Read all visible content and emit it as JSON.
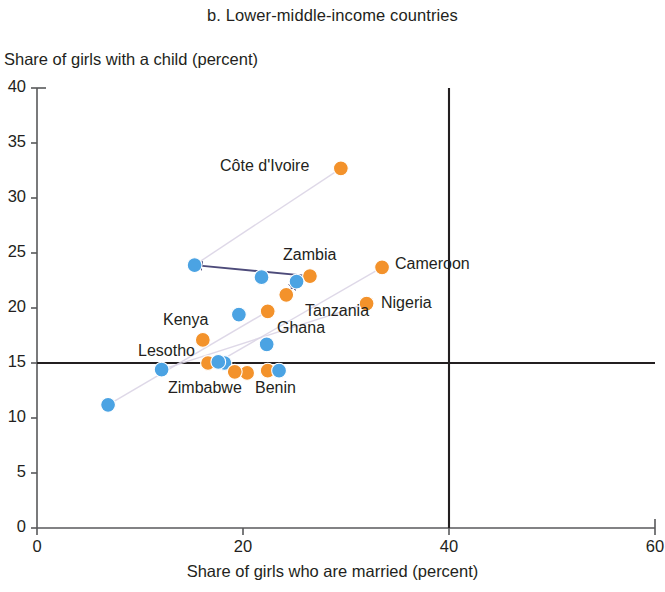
{
  "chart_data": {
    "type": "scatter",
    "title": "b. Lower-middle-income countries",
    "xlabel": "Share of girls who are married (percent)",
    "ylabel": "Share of girls with a child (percent)",
    "xlim": [
      0,
      60
    ],
    "ylim": [
      0,
      40
    ],
    "xticks": [
      0,
      20,
      40,
      60
    ],
    "yticks": [
      0,
      5,
      10,
      15,
      20,
      25,
      30,
      35,
      40
    ],
    "grid": false,
    "legend": "none",
    "reference_lines": [
      {
        "orientation": "horizontal",
        "value": 15
      },
      {
        "orientation": "vertical",
        "value": 40
      }
    ],
    "series": [
      {
        "name": "married-share (orange)",
        "color": "#f3922b",
        "marker": "circle"
      },
      {
        "name": "child-share (blue)",
        "color": "#4ba3e3",
        "marker": "circle"
      }
    ],
    "points": [
      {
        "label": "Côte d'Ivoire",
        "orange": {
          "x": 29.5,
          "y": 32.7
        },
        "blue": null,
        "arrow": false
      },
      {
        "label": "Cameroon",
        "orange": {
          "x": 33.5,
          "y": 23.7
        },
        "blue": null,
        "arrow": false
      },
      {
        "label": "Zambia",
        "orange": {
          "x": 26.5,
          "y": 22.9
        },
        "blue": {
          "x": 15.3,
          "y": 23.9
        },
        "arrow": true
      },
      {
        "label": "Nigeria",
        "orange": {
          "x": 32.0,
          "y": 20.4
        },
        "blue": null,
        "arrow": false
      },
      {
        "label": "Tanzania",
        "orange": {
          "x": 24.2,
          "y": 21.2
        },
        "blue": {
          "x": 25.2,
          "y": 22.4
        },
        "arrow": true
      },
      {
        "label": "Ghana",
        "orange": {
          "x": 22.4,
          "y": 19.7
        },
        "blue": null,
        "arrow": false
      },
      {
        "label": "Kenya",
        "orange": {
          "x": 16.1,
          "y": 17.1
        },
        "blue": {
          "x": 19.6,
          "y": 19.4
        },
        "arrow": false
      },
      {
        "label": "Lesotho",
        "orange": {
          "x": 16.6,
          "y": 15.0
        },
        "blue": {
          "x": 12.1,
          "y": 14.4
        },
        "arrow": false
      },
      {
        "label": "Zimbabwe",
        "orange": {
          "x": 19.2,
          "y": 14.2
        },
        "blue": {
          "x": 17.6,
          "y": 15.1
        },
        "arrow": false
      },
      {
        "label": "Benin",
        "orange": {
          "x": 22.4,
          "y": 14.3
        },
        "blue": {
          "x": 23.5,
          "y": 14.3
        },
        "arrow": true
      }
    ],
    "extra_points": [
      {
        "color": "blue",
        "x": 21.8,
        "y": 22.8
      },
      {
        "color": "blue",
        "x": 22.3,
        "y": 16.7
      },
      {
        "color": "blue",
        "x": 6.9,
        "y": 11.2
      },
      {
        "color": "blue",
        "x": 18.2,
        "y": 15.0
      },
      {
        "color": "orange",
        "x": 20.4,
        "y": 14.1
      }
    ]
  },
  "axis": {
    "y_tick_labels": [
      "40",
      "35",
      "30",
      "25",
      "20",
      "15",
      "10",
      "5",
      "0"
    ],
    "x_tick_labels": [
      "0",
      "20",
      "40",
      "60"
    ]
  },
  "labels": {
    "cote_divoire": "Côte d'Ivoire",
    "zambia": "Zambia",
    "cameroon": "Cameroon",
    "nigeria": "Nigeria",
    "tanzania": "Tanzania",
    "ghana": "Ghana",
    "kenya": "Kenya",
    "lesotho": "Lesotho",
    "zimbabwe": "Zimbabwe",
    "benin": "Benin"
  },
  "colors": {
    "orange": "#f3922b",
    "blue": "#4ba3e3",
    "axis": "#58595b",
    "arrow": "#4d4b7a",
    "text": "#231f20"
  }
}
